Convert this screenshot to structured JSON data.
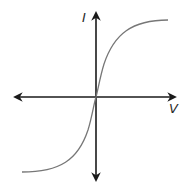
{
  "diagram": {
    "type": "iv-curve",
    "x_axis_label": "V",
    "y_axis_label": "I",
    "curve": "sigmoid passing through origin, saturating at positive and negative extremes",
    "colors": {
      "axes": "#1a1a1a",
      "curve": "#777777",
      "background": "#ffffff"
    }
  }
}
